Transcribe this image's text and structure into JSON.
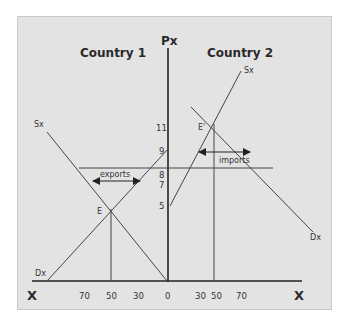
{
  "diagram": {
    "y_axis_label": "Px",
    "x_axis_left_label": "X",
    "x_axis_right_label": "X",
    "left_panel": {
      "title": "Country 1",
      "supply_label": "Sx",
      "demand_label": "Dx",
      "equilibrium_label": "E",
      "trade_label": "exports"
    },
    "right_panel": {
      "title": "Country 2",
      "supply_label": "Sx",
      "demand_label": "Dx",
      "equilibrium_label": "E'",
      "trade_label": "imports"
    },
    "price_ticks": [
      "11",
      "9",
      "8",
      "7",
      "5"
    ],
    "x_ticks_left": [
      "70",
      "50",
      "30"
    ],
    "x_tick_origin": "0",
    "x_ticks_right": [
      "30",
      "50",
      "70"
    ]
  },
  "colors": {
    "background": "#e3e3e3",
    "line": "#333333",
    "text": "#2a2a2a"
  }
}
